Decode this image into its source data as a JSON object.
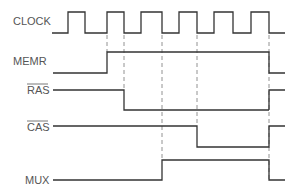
{
  "diagram": {
    "type": "timing-diagram",
    "colors": {
      "signal": "#333333",
      "label": "#555555",
      "guide": "#777777",
      "background": "#ffffff"
    },
    "signals": [
      {
        "name": "CLOCK",
        "overbar": false
      },
      {
        "name": "MEMR",
        "overbar": false
      },
      {
        "name": "RAS",
        "overbar": true
      },
      {
        "name": "CAS",
        "overbar": true
      },
      {
        "name": "MUX",
        "overbar": false
      }
    ],
    "guide_lines_x": [
      107,
      124,
      162,
      197,
      269
    ]
  }
}
